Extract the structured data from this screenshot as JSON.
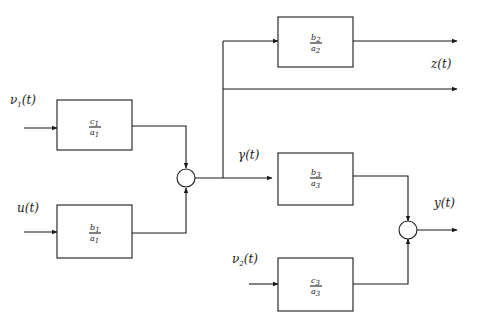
{
  "diagram": {
    "type": "block-diagram",
    "signals": {
      "nu1": {
        "label": "ν",
        "sub": "1",
        "arg": "(t)"
      },
      "u": {
        "label": "u",
        "sub": "",
        "arg": "(t)"
      },
      "gamma": {
        "label": "γ",
        "sub": "",
        "arg": "(t)"
      },
      "nu2": {
        "label": "ν",
        "sub": "2",
        "arg": "(t)"
      },
      "z": {
        "label": "z",
        "sub": "",
        "arg": "(t)"
      },
      "y": {
        "label": "y",
        "sub": "",
        "arg": "(t)"
      }
    },
    "blocks": {
      "c1a1": {
        "num": "c",
        "num_sub": "1",
        "den": "a",
        "den_sub": "1"
      },
      "b1a1": {
        "num": "b",
        "num_sub": "1",
        "den": "a",
        "den_sub": "1"
      },
      "b2a2": {
        "num": "b",
        "num_sub": "2",
        "den": "a",
        "den_sub": "2"
      },
      "b3a3": {
        "num": "b",
        "num_sub": "3",
        "den": "a",
        "den_sub": "3"
      },
      "c3a3": {
        "num": "c",
        "num_sub": "3",
        "den": "a",
        "den_sub": "3"
      }
    },
    "junctions": [
      "sum-1",
      "sum-2"
    ]
  }
}
